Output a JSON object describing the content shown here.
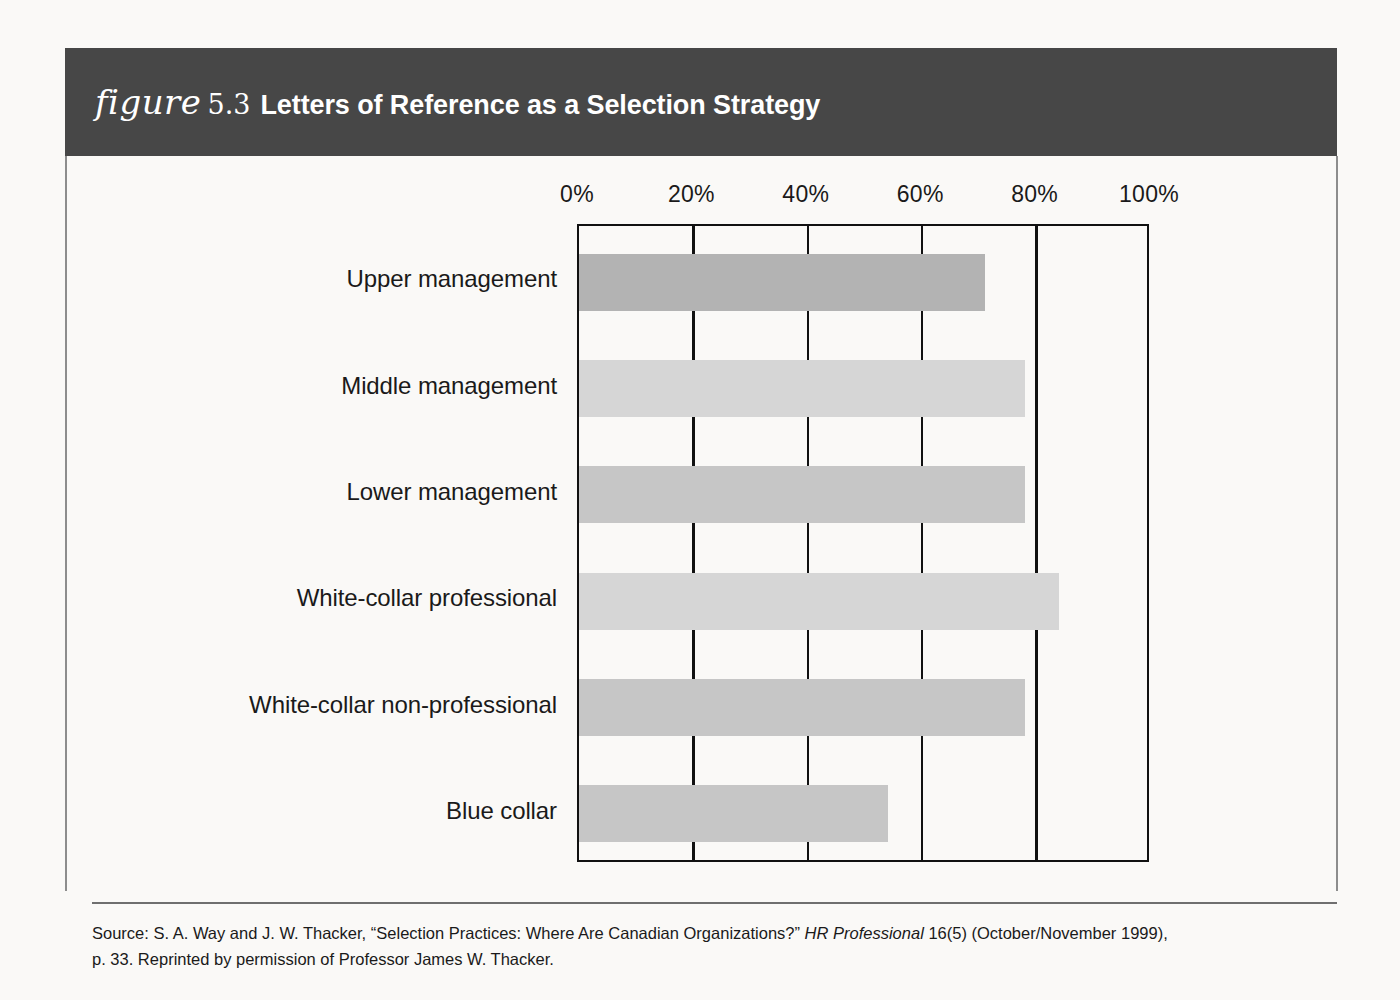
{
  "figure": {
    "label": "figure",
    "number": "5.3",
    "caption": "Letters of Reference as a Selection Strategy"
  },
  "colors": {
    "header_band": "#474747",
    "axis": "#111111",
    "page_background": "#faf9f7",
    "bar_dark": "#b3b3b3",
    "bar_mid": "#c6c6c6",
    "bar_light": "#d6d6d6"
  },
  "source": {
    "line1_prefix": "Source: S. A. Way and J. W. Thacker, “Selection Practices: Where Are Canadian Organizations?” ",
    "line1_italic": "HR Professional",
    "line1_suffix": " 16(5) (October/November 1999),",
    "line2": "p. 33. Reprinted by permission of Professor James W. Thacker."
  },
  "chart_data": {
    "type": "bar",
    "orientation": "horizontal",
    "title": "Letters of Reference as a Selection Strategy",
    "xlabel": "",
    "ylabel": "",
    "xlim": [
      0,
      100
    ],
    "grid": true,
    "legend": false,
    "tick_labels": [
      "0%",
      "20%",
      "40%",
      "60%",
      "80%",
      "100%"
    ],
    "ticks": [
      0,
      20,
      40,
      60,
      80,
      100
    ],
    "categories": [
      "Upper management",
      "Middle management",
      "Lower management",
      "White-collar professional",
      "White-collar non-professional",
      "Blue collar"
    ],
    "values": [
      71,
      78,
      78,
      84,
      78,
      54
    ],
    "bar_colors": [
      "#b3b3b3",
      "#d6d6d6",
      "#c6c6c6",
      "#d6d6d6",
      "#c6c6c6",
      "#c6c6c6"
    ]
  }
}
